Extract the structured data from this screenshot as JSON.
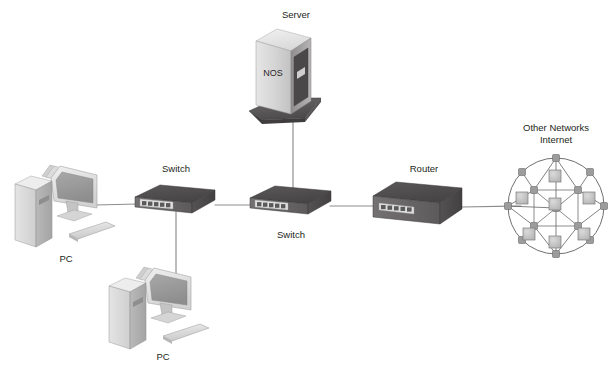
{
  "diagram": {
    "background_color": "#ffffff",
    "label_color": "#231f20",
    "link_color": "#8d8d8d"
  },
  "labels": {
    "server": "Server",
    "nos": "NOS",
    "switch_left": "Switch",
    "switch_middle": "Switch",
    "router": "Router",
    "pc_left": "PC",
    "pc_bottom": "PC",
    "cloud_line1": "Other Networks",
    "cloud_line2": "Internet"
  },
  "nodes": [
    {
      "id": "server",
      "type": "server-tower",
      "label": "Server",
      "badge": "NOS",
      "x": 285,
      "y": 75
    },
    {
      "id": "switch-left",
      "type": "switch",
      "label": "Switch",
      "x": 175,
      "y": 200
    },
    {
      "id": "switch-middle",
      "type": "switch",
      "label": "Switch",
      "x": 290,
      "y": 200
    },
    {
      "id": "router",
      "type": "router",
      "label": "Router",
      "x": 420,
      "y": 200
    },
    {
      "id": "pc-left",
      "type": "workstation",
      "label": "PC",
      "x": 60,
      "y": 205
    },
    {
      "id": "pc-bottom",
      "type": "workstation",
      "label": "PC",
      "x": 160,
      "y": 305
    },
    {
      "id": "internet",
      "type": "network-cloud",
      "label": "Other Networks Internet",
      "x": 555,
      "y": 205
    }
  ],
  "links": [
    {
      "from": "pc-left",
      "to": "switch-left",
      "orientation": "horizontal"
    },
    {
      "from": "pc-bottom",
      "to": "switch-left",
      "orientation": "vertical"
    },
    {
      "from": "switch-left",
      "to": "switch-middle",
      "orientation": "horizontal"
    },
    {
      "from": "server",
      "to": "switch-middle",
      "orientation": "vertical"
    },
    {
      "from": "switch-middle",
      "to": "router",
      "orientation": "horizontal"
    },
    {
      "from": "router",
      "to": "internet",
      "orientation": "horizontal"
    }
  ],
  "colors": {
    "tower_front": "#d8d8d8",
    "tower_side": "#b4b4b4",
    "tower_top": "#ececec",
    "screen": "#9d9d9d",
    "device_top": "#4e4c4d",
    "device_front": "#656364",
    "device_side": "#555354",
    "port_strip": "#e2e2e2",
    "cloud_node": "#9a9a9a",
    "cloud_square": "#c6c6c6"
  },
  "counts": {
    "cloud_perimeter_nodes": 8,
    "cloud_inner_squares": 7,
    "switch_ports": 5
  }
}
